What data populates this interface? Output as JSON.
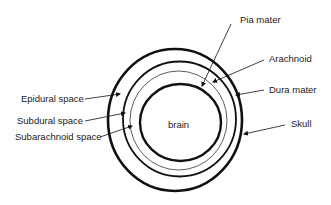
{
  "diagram": {
    "center_label": "brain",
    "colors": {
      "stroke": "#111111",
      "thin_stroke": "#333333",
      "text": "#222222",
      "background": "#ffffff"
    },
    "rings": [
      {
        "name": "Skull",
        "cx": 175,
        "cy": 120,
        "rx": 67,
        "ry": 71,
        "stroke_width": 2.6
      },
      {
        "name": "Dura mater",
        "cx": 179.5,
        "cy": 119,
        "rx": 56.5,
        "ry": 57.5,
        "stroke_width": 1.8
      },
      {
        "name": "Arachnoid",
        "cx": 178.5,
        "cy": 120.5,
        "rx": 48.5,
        "ry": 49.5,
        "stroke_width": 0.8
      },
      {
        "name": "brain",
        "cx": 180.5,
        "cy": 122.5,
        "rx": 40.5,
        "ry": 38.5,
        "stroke_width": 2.4
      }
    ],
    "labels_left": [
      {
        "text": "Epidural space",
        "x": 21,
        "y": 102,
        "line": [
          85,
          99,
          120,
          94
        ]
      },
      {
        "text": "Subdural space",
        "x": 17,
        "y": 124,
        "line": [
          85,
          121,
          125,
          113
        ]
      },
      {
        "text": "Subarachnoid space",
        "x": 15,
        "y": 140,
        "line": [
          100,
          137,
          132,
          126
        ]
      }
    ],
    "labels_right": [
      {
        "text": "Pia mater",
        "x": 240,
        "y": 23,
        "line": [
          231,
          24,
          202,
          86
        ]
      },
      {
        "text": "Arachnoid",
        "x": 269,
        "y": 62,
        "line": [
          264,
          60,
          213,
          82
        ]
      },
      {
        "text": "Dura mater",
        "x": 269,
        "y": 93,
        "line": [
          264,
          90,
          236,
          95
        ]
      },
      {
        "text": "Skull",
        "x": 291,
        "y": 127,
        "line": [
          285,
          125,
          244,
          134
        ]
      }
    ]
  }
}
